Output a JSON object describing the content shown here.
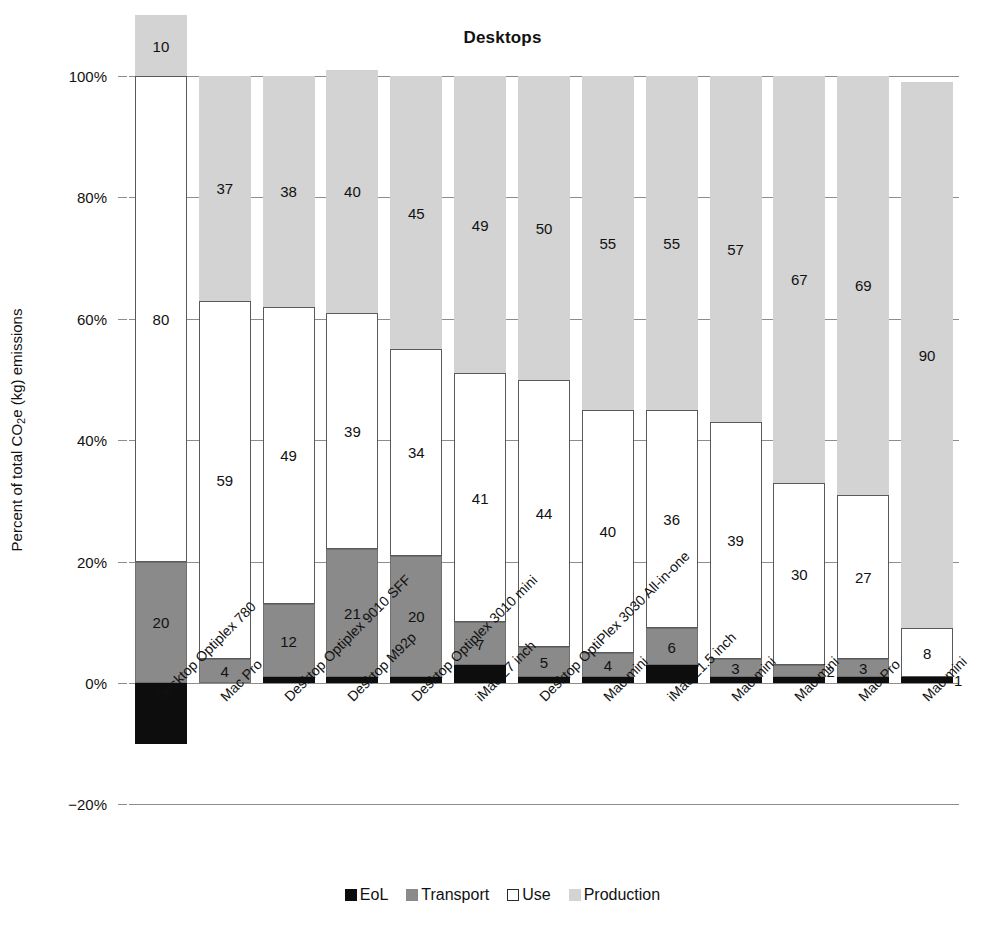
{
  "chart_data": {
    "type": "bar",
    "subtype": "stacked-bar-100",
    "title": "Desktops",
    "xlabel": "",
    "ylabel": "Percent of total CO2e (kg) emissions",
    "ylabel_parts": {
      "pre": "Percent of total CO",
      "sub": "2",
      "post": "e (kg) emissions"
    },
    "ylim": [
      -20,
      100
    ],
    "yticks": [
      100,
      80,
      60,
      40,
      20,
      0,
      -20
    ],
    "ytick_labels": [
      "100%",
      "80%",
      "60%",
      "40%",
      "20%",
      "0%",
      "−20%"
    ],
    "grid": true,
    "legend_position": "bottom",
    "categories": [
      "Desktop Optiplex 780",
      "Mac Pro",
      "Desktop Optiplex 9010 SFF",
      "Desktop M92p",
      "Desktop Optiplex 3010 mini",
      "iMac 27 inch",
      "Desktop OptiPlex 3030 All-in-one",
      "Mac mini",
      "iMac 21.5 inch",
      "Mac mini",
      "Mac mini",
      "Mac Pro",
      "Mac mini"
    ],
    "series": [
      {
        "name": "EoL",
        "color": "#0d0d0d",
        "values": [
          -10,
          0,
          1,
          1,
          1,
          3,
          1,
          1,
          3,
          1,
          1,
          1,
          1
        ],
        "labels": [
          "",
          "",
          "",
          "",
          "",
          "",
          "",
          "",
          "",
          "",
          "",
          "",
          "1"
        ]
      },
      {
        "name": "Transport",
        "color": "#8a8a8a",
        "values": [
          20,
          4,
          12,
          21,
          20,
          7,
          5,
          4,
          6,
          3,
          2,
          3,
          0
        ],
        "labels": [
          "20",
          "4",
          "12",
          "21",
          "20",
          "7",
          "5",
          "4",
          "6",
          "3",
          "2",
          "3",
          ""
        ]
      },
      {
        "name": "Use",
        "color": "#ffffff",
        "values": [
          80,
          59,
          49,
          39,
          34,
          41,
          44,
          40,
          36,
          39,
          30,
          27,
          8
        ],
        "labels": [
          "80",
          "59",
          "49",
          "39",
          "34",
          "41",
          "44",
          "40",
          "36",
          "39",
          "30",
          "27",
          "8"
        ]
      },
      {
        "name": "Production",
        "color": "#d3d3d3",
        "values": [
          10,
          37,
          38,
          40,
          45,
          49,
          50,
          55,
          55,
          57,
          67,
          69,
          90
        ],
        "labels": [
          "10",
          "37",
          "38",
          "40",
          "45",
          "49",
          "50",
          "55",
          "55",
          "57",
          "67",
          "69",
          "90"
        ]
      }
    ]
  },
  "legend": {
    "items": [
      {
        "label": "EoL",
        "swatch": "eol"
      },
      {
        "label": "Transport",
        "swatch": "transport"
      },
      {
        "label": "Use",
        "swatch": "use"
      },
      {
        "label": "Production",
        "swatch": "production"
      }
    ]
  }
}
